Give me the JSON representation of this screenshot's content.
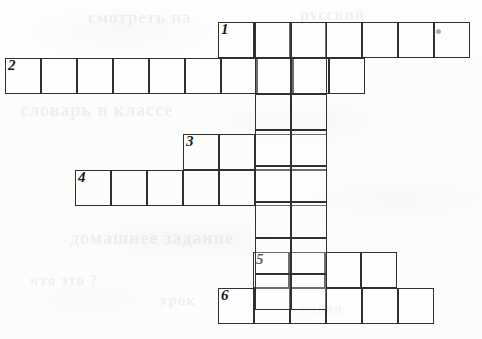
{
  "document": {
    "type": "crossword-puzzle-grid",
    "title": "",
    "background_color": "#fdfdfc",
    "line_color": "#2f3033",
    "number_color": "#17181a"
  },
  "grid": {
    "cell_size": 36,
    "entries": [
      {
        "number": "1",
        "direction": "across",
        "cells": 7,
        "x": 218,
        "y": 22,
        "width": 252,
        "height": 36
      },
      {
        "number": "2",
        "direction": "across",
        "cells": 10,
        "x": 5,
        "y": 58,
        "width": 360,
        "height": 36
      },
      {
        "number": "3",
        "direction": "across",
        "cells": 4,
        "x": 183,
        "y": 134,
        "width": 144,
        "height": 36
      },
      {
        "number": "4",
        "direction": "across",
        "cells": 7,
        "x": 75,
        "y": 170,
        "width": 252,
        "height": 36
      },
      {
        "number": "5",
        "direction": "across",
        "cells": 4,
        "x": 253,
        "y": 252,
        "width": 144,
        "height": 36
      },
      {
        "number": "6",
        "direction": "across",
        "cells": 6,
        "x": 218,
        "y": 288,
        "width": 216,
        "height": 36
      }
    ],
    "columns": [
      {
        "name": "column-a",
        "x": 255,
        "y_top": 22,
        "y_bottom": 324,
        "cells": 8
      },
      {
        "name": "column-b",
        "x": 291,
        "y_top": 22,
        "y_bottom": 324,
        "cells": 8
      }
    ],
    "marks": [
      {
        "name": "ink-speck",
        "x": 436,
        "y": 29
      }
    ]
  },
  "ghost_text": [
    {
      "text": "смотреть на",
      "x": 88,
      "y": 8,
      "size": 17
    },
    {
      "text": "русский",
      "x": 300,
      "y": 6,
      "size": 16
    },
    {
      "text": "словарь в классе",
      "x": 20,
      "y": 100,
      "size": 18
    },
    {
      "text": "домашнее задание",
      "x": 70,
      "y": 228,
      "size": 18
    },
    {
      "text": "что это ?",
      "x": 30,
      "y": 272,
      "size": 15
    },
    {
      "text": "урок",
      "x": 160,
      "y": 292,
      "size": 15
    },
    {
      "text": "слово",
      "x": 300,
      "y": 300,
      "size": 15
    }
  ]
}
